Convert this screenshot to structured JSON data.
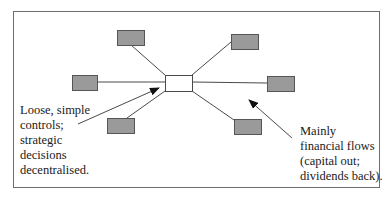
{
  "diagram": {
    "type": "hub-and-spoke",
    "colors": {
      "frame": "#6e6e6e",
      "node_fill": "#9a9a9a",
      "node_stroke": "#555555",
      "hub_fill": "#ffffff",
      "line": "#4a4a4a",
      "arrow": "#111111"
    },
    "hub": {
      "x": 165,
      "y": 75,
      "w": 27,
      "h": 16
    },
    "nodes": [
      {
        "id": "top-left",
        "x": 117,
        "y": 30,
        "w": 27,
        "h": 15,
        "connect": [
          131,
          45,
          165,
          75
        ]
      },
      {
        "id": "top-right",
        "x": 231,
        "y": 34,
        "w": 27,
        "h": 15,
        "connect": [
          231,
          42,
          192,
          75
        ]
      },
      {
        "id": "left",
        "x": 72,
        "y": 75,
        "w": 25,
        "h": 15,
        "connect": [
          97,
          82,
          165,
          82
        ]
      },
      {
        "id": "right",
        "x": 267,
        "y": 76,
        "w": 27,
        "h": 15,
        "connect": [
          192,
          82,
          267,
          83
        ]
      },
      {
        "id": "bottom-left",
        "x": 107,
        "y": 118,
        "w": 27,
        "h": 15,
        "connect": [
          127,
          118,
          165,
          91
        ]
      },
      {
        "id": "bottom-right",
        "x": 234,
        "y": 119,
        "w": 27,
        "h": 15,
        "connect": [
          234,
          120,
          192,
          91
        ]
      }
    ],
    "arrows": [
      {
        "id": "arrow-controls",
        "from": [
          78,
          124
        ],
        "to": [
          159,
          88
        ]
      },
      {
        "id": "arrow-financial",
        "from": [
          292,
          138
        ],
        "to": [
          249,
          100
        ]
      }
    ],
    "labels": {
      "left": [
        "Loose, simple",
        "controls;",
        "strategic",
        "decisions",
        "decentralised."
      ],
      "right": [
        "Mainly",
        "financial flows",
        "(capital out;",
        "dividends back)."
      ]
    }
  }
}
